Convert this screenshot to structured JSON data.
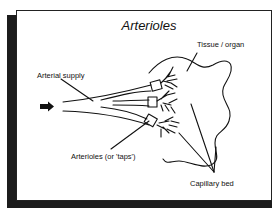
{
  "diagram": {
    "title": "Arterioles",
    "labels": {
      "tissue": "Tissue / organ",
      "arterial_supply": "Arterial supply",
      "arterioles": "Arterioles (or 'taps')",
      "capillary_bed": "Capillary bed"
    },
    "icons": {
      "flow_arrow": "right-arrow"
    },
    "colors": {
      "ink": "#111111",
      "shadow": "#1c1c1c",
      "background": "#ffffff"
    }
  }
}
